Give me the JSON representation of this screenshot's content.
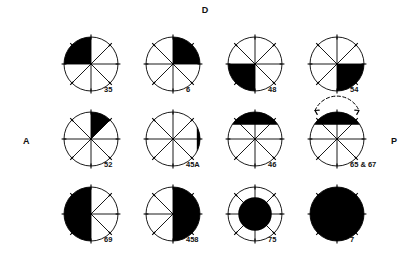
{
  "figure": {
    "axes": {
      "dorsal": "D",
      "anterior": "A",
      "posterior": "P"
    },
    "stroke_color": "#000000",
    "fill_color": "#000000",
    "background": "#ffffff",
    "spokes": 8,
    "rows": [
      {
        "cells": [
          {
            "label": "35",
            "pattern": "quadrant-upper-left",
            "desc": "upper-left quadrant filled"
          },
          {
            "label": "6",
            "pattern": "quadrant-upper-right",
            "desc": "upper-right quadrant filled"
          },
          {
            "label": "48",
            "pattern": "quadrant-lower-left",
            "desc": "lower-left quadrant filled"
          },
          {
            "label": "54",
            "pattern": "quadrant-lower-right",
            "desc": "lower-right quadrant filled"
          }
        ]
      },
      {
        "cells": [
          {
            "label": "52",
            "pattern": "sector-upper-right-45",
            "desc": "single 45 degree sector clockwise from top"
          },
          {
            "label": "45A",
            "pattern": "segment-right",
            "desc": "narrow chord segment on right edge"
          },
          {
            "label": "46",
            "pattern": "segment-top",
            "desc": "narrow chord segment across top"
          },
          {
            "label": "65 & 67",
            "pattern": "segment-top-arrows",
            "desc": "top chord segment with spreading arrows above"
          }
        ]
      },
      {
        "cells": [
          {
            "label": "69",
            "pattern": "half-left",
            "desc": "left half filled"
          },
          {
            "label": "458",
            "pattern": "half-right",
            "desc": "right half filled"
          },
          {
            "label": "75",
            "pattern": "inner-disc",
            "desc": "concentric inner disc filled"
          },
          {
            "label": "7",
            "pattern": "full",
            "desc": "entire disc filled"
          }
        ]
      }
    ]
  }
}
